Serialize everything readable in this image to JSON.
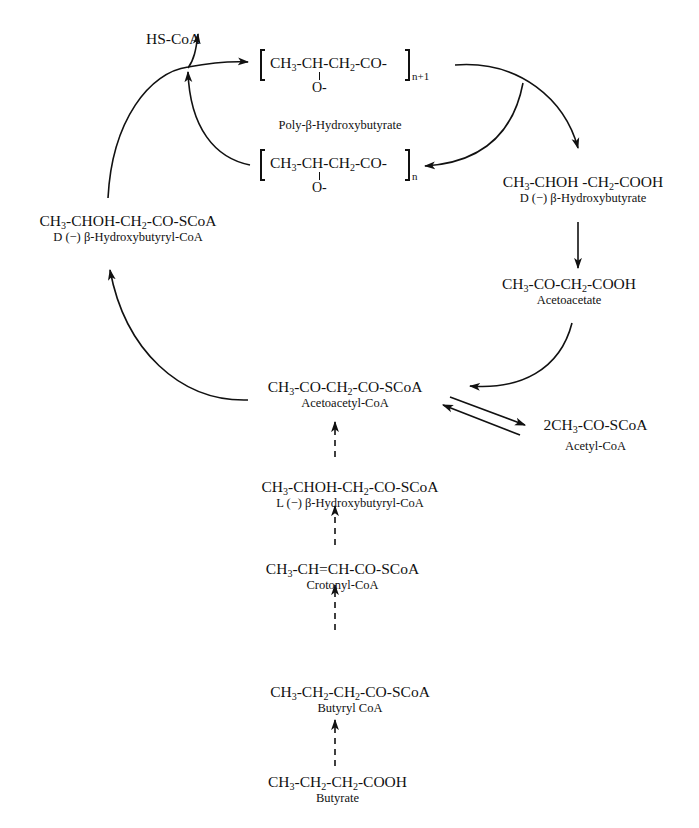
{
  "diagram": {
    "type": "metabolic-pathway",
    "nodes": {
      "hscoa": {
        "formula": "HS-CoA"
      },
      "polymer_n1": {
        "formula_parts": [
          "CH",
          "3",
          "-CH-CH",
          "2",
          "-CO-"
        ],
        "pendant": "O-",
        "subscript": "n+1",
        "name": "Poly-β-Hydroxybutyrate"
      },
      "polymer_n": {
        "formula_parts": [
          "CH",
          "3",
          "-CH-CH",
          "2",
          "-CO-"
        ],
        "pendant": "O-",
        "subscript": "n"
      },
      "d_hb_coa": {
        "formula_parts": [
          "CH",
          "3",
          "-CHOH-CH",
          "2",
          "-CO-SCoA"
        ],
        "name": "D (−) β-Hydroxybutyryl-CoA"
      },
      "d_hb": {
        "formula_parts": [
          "CH",
          "3",
          "-CHOH -CH",
          "2",
          "-COOH"
        ],
        "name": "D (−) β-Hydroxybutyrate"
      },
      "acetoacetate": {
        "formula_parts": [
          "CH",
          "3",
          "-CO-CH",
          "2",
          "-COOH"
        ],
        "name": "Acetoacetate"
      },
      "acetoacetyl_coa": {
        "formula_parts": [
          "CH",
          "3",
          "-CO-CH",
          "2",
          "-CO-SCoA"
        ],
        "name": "Acetoacetyl-CoA"
      },
      "acetyl_coa": {
        "formula_parts": [
          "2CH",
          "3",
          "-CO-SCoA",
          "",
          ""
        ],
        "name": "Acetyl-CoA"
      },
      "l_hb_coa": {
        "formula_parts": [
          "CH",
          "3",
          "-CHOH-CH",
          "2",
          "-CO-SCoA"
        ],
        "name": "L (−) β-Hydroxybutyryl-CoA"
      },
      "crotonyl_coa": {
        "formula_parts": [
          "CH",
          "3",
          "-CH=CH-CO-SCoA",
          "",
          ""
        ],
        "name": "Crotonyl-CoA"
      },
      "butyryl_coa": {
        "formula_parts": [
          "CH",
          "3",
          "-CH",
          "2",
          "-CH"
        ],
        "formula_tail": [
          "2",
          "-CO-SCoA"
        ],
        "name": "Butyryl CoA"
      },
      "butyrate": {
        "formula_parts": [
          "CH",
          "3",
          "-CH",
          "2",
          "-CH"
        ],
        "formula_tail": [
          "2",
          "-COOH"
        ],
        "name": "Butyrate"
      }
    },
    "edges": [
      {
        "from": "d_hb_coa",
        "to": "polymer_n1",
        "style": "solid",
        "note": "releases HS-CoA"
      },
      {
        "from": "polymer_n",
        "to": "polymer_n1",
        "style": "solid"
      },
      {
        "from": "polymer_n1",
        "to": "d_hb",
        "style": "solid"
      },
      {
        "from": "polymer_n1",
        "to": "polymer_n",
        "style": "solid"
      },
      {
        "from": "d_hb",
        "to": "acetoacetate",
        "style": "solid"
      },
      {
        "from": "acetoacetate",
        "to": "acetoacetyl_coa",
        "style": "solid"
      },
      {
        "from": "acetoacetyl_coa",
        "to": "acetyl_coa",
        "style": "solid",
        "reversible": true
      },
      {
        "from": "acetoacetyl_coa",
        "to": "d_hb_coa",
        "style": "solid"
      },
      {
        "from": "l_hb_coa",
        "to": "acetoacetyl_coa",
        "style": "dashed"
      },
      {
        "from": "crotonyl_coa",
        "to": "l_hb_coa",
        "style": "dashed"
      },
      {
        "from": "butyryl_coa",
        "to": "crotonyl_coa",
        "style": "dashed"
      },
      {
        "from": "butyrate",
        "to": "butyryl_coa",
        "style": "dashed"
      }
    ],
    "colors": {
      "ink": "#111111",
      "background": "#ffffff"
    }
  }
}
